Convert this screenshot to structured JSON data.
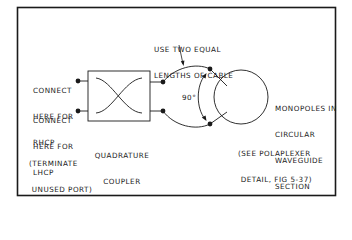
{
  "colors": {
    "ink": "#1a1a1a",
    "background": "#ffffff"
  },
  "labels": {
    "rhcp": [
      "CONNECT",
      "HERE FOR",
      "RHCP"
    ],
    "lhcp": [
      "CONNECT",
      "HERE FOR",
      "LHCP"
    ],
    "terminate": [
      "(TERMINATE",
      " UNUSED PORT)"
    ],
    "coupler": [
      "QUADRATURE",
      "COUPLER"
    ],
    "cable": [
      "USE TWO EQUAL",
      "LENGTHS OF CABLE"
    ],
    "angle": "90°",
    "monopoles": [
      "MONOPOLES IN",
      "CIRCULAR",
      "WAVEGUIDE",
      "SECTION"
    ],
    "see_ref": [
      "(SEE POLAPLEXER",
      " DETAIL, FIG 5-37)"
    ]
  }
}
